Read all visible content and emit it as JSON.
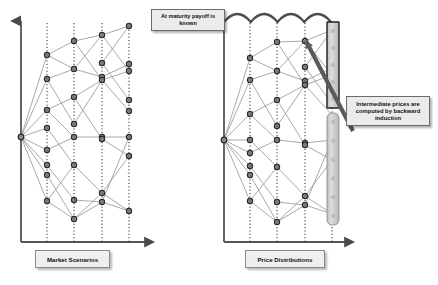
{
  "figure": {
    "background": "#ffffff",
    "accent_dark": "#3a3a3a",
    "node_fill": "#8c8c8c",
    "node_stroke": "#2b2b2b",
    "edge_color": "#9a9a9a",
    "axis_color": "#555555",
    "bar_fill": "#cfcfcf",
    "bar_stroke": "#888888"
  },
  "panels": {
    "left": {
      "axis_label": "Market Scenarios",
      "callout": "At maturity payoff is known",
      "origin": {
        "x": 21,
        "y": 137
      },
      "axis": {
        "x": 21,
        "y_top": 17,
        "y_bottom": 242,
        "x_right": 152
      },
      "columns_x": [
        47,
        74,
        102,
        129
      ],
      "nodes": [
        {
          "col": 0,
          "y": 55
        },
        {
          "col": 0,
          "y": 79
        },
        {
          "col": 0,
          "y": 110
        },
        {
          "col": 0,
          "y": 128
        },
        {
          "col": 0,
          "y": 150
        },
        {
          "col": 0,
          "y": 165
        },
        {
          "col": 0,
          "y": 175
        },
        {
          "col": 0,
          "y": 201
        },
        {
          "col": 1,
          "y": 41
        },
        {
          "col": 1,
          "y": 69
        },
        {
          "col": 1,
          "y": 97
        },
        {
          "col": 1,
          "y": 124
        },
        {
          "col": 1,
          "y": 137
        },
        {
          "col": 1,
          "y": 165
        },
        {
          "col": 1,
          "y": 200
        },
        {
          "col": 1,
          "y": 219
        },
        {
          "col": 2,
          "y": 35
        },
        {
          "col": 2,
          "y": 63
        },
        {
          "col": 2,
          "y": 77
        },
        {
          "col": 2,
          "y": 80
        },
        {
          "col": 2,
          "y": 137
        },
        {
          "col": 2,
          "y": 139
        },
        {
          "col": 2,
          "y": 193
        },
        {
          "col": 2,
          "y": 202
        },
        {
          "col": 3,
          "y": 26
        },
        {
          "col": 3,
          "y": 64
        },
        {
          "col": 3,
          "y": 71
        },
        {
          "col": 3,
          "y": 100
        },
        {
          "col": 3,
          "y": 111
        },
        {
          "col": 3,
          "y": 137
        },
        {
          "col": 3,
          "y": 156
        },
        {
          "col": 3,
          "y": 211
        }
      ],
      "edges": [
        [
          21,
          137,
          47,
          55
        ],
        [
          21,
          137,
          47,
          79
        ],
        [
          21,
          137,
          47,
          110
        ],
        [
          21,
          137,
          47,
          128
        ],
        [
          21,
          137,
          47,
          150
        ],
        [
          21,
          137,
          47,
          165
        ],
        [
          21,
          137,
          47,
          175
        ],
        [
          21,
          137,
          47,
          201
        ],
        [
          47,
          55,
          74,
          41
        ],
        [
          47,
          55,
          74,
          69
        ],
        [
          47,
          79,
          74,
          69
        ],
        [
          47,
          79,
          74,
          124
        ],
        [
          47,
          110,
          74,
          97
        ],
        [
          47,
          110,
          74,
          137
        ],
        [
          47,
          128,
          74,
          165
        ],
        [
          47,
          150,
          74,
          137
        ],
        [
          47,
          165,
          74,
          200
        ],
        [
          47,
          175,
          74,
          219
        ],
        [
          47,
          201,
          74,
          219
        ],
        [
          47,
          201,
          74,
          165
        ],
        [
          74,
          41,
          102,
          35
        ],
        [
          74,
          41,
          102,
          80
        ],
        [
          74,
          69,
          102,
          35
        ],
        [
          74,
          69,
          102,
          77
        ],
        [
          74,
          97,
          102,
          80
        ],
        [
          74,
          97,
          102,
          139
        ],
        [
          74,
          124,
          102,
          80
        ],
        [
          74,
          137,
          102,
          137
        ],
        [
          74,
          165,
          102,
          193
        ],
        [
          74,
          200,
          102,
          202
        ],
        [
          74,
          219,
          102,
          193
        ],
        [
          74,
          219,
          102,
          202
        ],
        [
          102,
          35,
          129,
          26
        ],
        [
          102,
          35,
          129,
          71
        ],
        [
          102,
          63,
          129,
          26
        ],
        [
          102,
          63,
          129,
          100
        ],
        [
          102,
          77,
          129,
          64
        ],
        [
          102,
          80,
          129,
          71
        ],
        [
          102,
          80,
          129,
          111
        ],
        [
          102,
          137,
          129,
          137
        ],
        [
          102,
          139,
          129,
          156
        ],
        [
          102,
          193,
          129,
          156
        ],
        [
          102,
          193,
          129,
          211
        ],
        [
          102,
          202,
          129,
          211
        ],
        [
          102,
          202,
          129,
          137
        ]
      ]
    },
    "right": {
      "axis_label": "Price Distributions",
      "callout": "Intermediate prices are computed by backward induction",
      "origin": {
        "x": 224,
        "y": 140
      },
      "axis": {
        "x": 224,
        "y_top": 17,
        "y_bottom": 242,
        "x_right": 352
      },
      "columns_x": [
        250,
        277,
        305,
        332
      ],
      "scallop_count": 4,
      "bars": [
        {
          "x": 327,
          "y": 22,
          "w": 12,
          "h": 86,
          "rounded": false
        },
        {
          "x": 327,
          "y": 113,
          "w": 12,
          "h": 112,
          "rounded": true
        }
      ],
      "nodes": [
        {
          "col": 0,
          "y": 58
        },
        {
          "col": 0,
          "y": 80
        },
        {
          "col": 0,
          "y": 114
        },
        {
          "col": 0,
          "y": 140
        },
        {
          "col": 0,
          "y": 153
        },
        {
          "col": 0,
          "y": 166
        },
        {
          "col": 0,
          "y": 175
        },
        {
          "col": 0,
          "y": 201
        },
        {
          "col": 1,
          "y": 42
        },
        {
          "col": 1,
          "y": 71
        },
        {
          "col": 1,
          "y": 100
        },
        {
          "col": 1,
          "y": 126
        },
        {
          "col": 1,
          "y": 140
        },
        {
          "col": 1,
          "y": 167
        },
        {
          "col": 1,
          "y": 202
        },
        {
          "col": 1,
          "y": 222
        },
        {
          "col": 2,
          "y": 41
        },
        {
          "col": 2,
          "y": 67
        },
        {
          "col": 2,
          "y": 81
        },
        {
          "col": 2,
          "y": 85
        },
        {
          "col": 2,
          "y": 143
        },
        {
          "col": 2,
          "y": 145
        },
        {
          "col": 2,
          "y": 196
        },
        {
          "col": 2,
          "y": 205
        }
      ],
      "edges": [
        [
          224,
          140,
          250,
          58
        ],
        [
          224,
          140,
          250,
          80
        ],
        [
          224,
          140,
          250,
          114
        ],
        [
          224,
          140,
          250,
          140
        ],
        [
          224,
          140,
          250,
          153
        ],
        [
          224,
          140,
          250,
          166
        ],
        [
          224,
          140,
          250,
          175
        ],
        [
          224,
          140,
          250,
          201
        ],
        [
          250,
          58,
          277,
          42
        ],
        [
          250,
          58,
          277,
          71
        ],
        [
          250,
          80,
          277,
          71
        ],
        [
          250,
          80,
          277,
          126
        ],
        [
          250,
          114,
          277,
          100
        ],
        [
          250,
          114,
          277,
          140
        ],
        [
          250,
          140,
          277,
          167
        ],
        [
          250,
          153,
          277,
          140
        ],
        [
          250,
          166,
          277,
          202
        ],
        [
          250,
          175,
          277,
          222
        ],
        [
          250,
          201,
          277,
          222
        ],
        [
          250,
          201,
          277,
          167
        ],
        [
          277,
          42,
          305,
          41
        ],
        [
          277,
          42,
          305,
          85
        ],
        [
          277,
          71,
          305,
          41
        ],
        [
          277,
          71,
          305,
          81
        ],
        [
          277,
          100,
          305,
          85
        ],
        [
          277,
          100,
          305,
          145
        ],
        [
          277,
          126,
          305,
          85
        ],
        [
          277,
          140,
          305,
          143
        ],
        [
          277,
          167,
          305,
          196
        ],
        [
          277,
          202,
          305,
          205
        ],
        [
          277,
          222,
          305,
          196
        ],
        [
          277,
          222,
          305,
          205
        ],
        [
          305,
          41,
          332,
          30
        ],
        [
          305,
          41,
          332,
          75
        ],
        [
          305,
          67,
          332,
          30
        ],
        [
          305,
          67,
          332,
          104
        ],
        [
          305,
          81,
          332,
          68
        ],
        [
          305,
          85,
          332,
          75
        ],
        [
          305,
          85,
          332,
          115
        ],
        [
          305,
          143,
          332,
          140
        ],
        [
          305,
          145,
          332,
          160
        ],
        [
          305,
          196,
          332,
          160
        ],
        [
          305,
          196,
          332,
          214
        ],
        [
          305,
          205,
          332,
          214
        ],
        [
          305,
          205,
          332,
          140
        ]
      ],
      "pointer": {
        "x1": 353,
        "y1": 131,
        "x2": 306,
        "y2": 41
      }
    }
  }
}
